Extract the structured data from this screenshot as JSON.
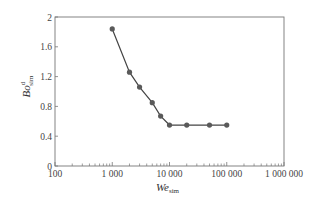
{
  "chart_data": {
    "type": "line",
    "title": "",
    "xlabel": "We_sim",
    "xlabel_main": "We",
    "xlabel_sub": "sim",
    "ylabel": "Bo^d_sim",
    "ylabel_main": "Bo",
    "ylabel_sup": "d",
    "ylabel_sub": "sim",
    "xscale": "log",
    "xlim": [
      100,
      1000000
    ],
    "ylim": [
      0,
      2
    ],
    "x_ticks": [
      100,
      1000,
      10000,
      100000,
      1000000
    ],
    "x_tick_labels": [
      "100",
      "1 000",
      "10 000",
      "100 000",
      "1 000 000"
    ],
    "y_ticks": [
      0,
      0.4,
      0.8,
      1.2,
      1.6,
      2
    ],
    "y_tick_labels": [
      "0",
      "0.4",
      "0.8",
      "1.2",
      "1.6",
      "2"
    ],
    "grid": false,
    "legend": null,
    "series": [
      {
        "name": "Bo^d_sim",
        "marker": "circle",
        "color": "#555555",
        "x": [
          1000,
          2000,
          3000,
          5000,
          7000,
          10000,
          20000,
          50000,
          100000
        ],
        "y": [
          1.84,
          1.26,
          1.06,
          0.85,
          0.67,
          0.55,
          0.55,
          0.55,
          0.55
        ]
      }
    ]
  },
  "colors": {
    "axis": "#777777",
    "line": "#444444",
    "marker": "#5a5a5a"
  }
}
